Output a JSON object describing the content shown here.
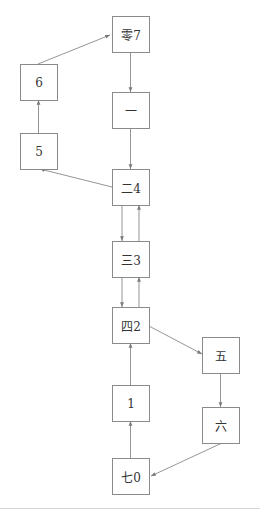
{
  "diagram": {
    "type": "directed-graph",
    "colors": {
      "node_border": "#8a8a8a",
      "edge": "#7a7a7a",
      "text": "#333333",
      "separator": "#d4d4d4"
    },
    "nodes": [
      {
        "id": "n_ling7",
        "label": "零7",
        "x": 112,
        "y": 16
      },
      {
        "id": "n_yi",
        "label": "一",
        "x": 112,
        "y": 92
      },
      {
        "id": "n_er4",
        "label": "二4",
        "x": 112,
        "y": 169
      },
      {
        "id": "n_san3",
        "label": "三3",
        "x": 112,
        "y": 241
      },
      {
        "id": "n_si2",
        "label": "四2",
        "x": 112,
        "y": 307
      },
      {
        "id": "n_1",
        "label": "1",
        "x": 112,
        "y": 385
      },
      {
        "id": "n_qi0",
        "label": "七0",
        "x": 112,
        "y": 458
      },
      {
        "id": "n_6",
        "label": "6",
        "x": 20,
        "y": 64
      },
      {
        "id": "n_5",
        "label": "5",
        "x": 20,
        "y": 133
      },
      {
        "id": "n_wu",
        "label": "五",
        "x": 202,
        "y": 337
      },
      {
        "id": "n_liu",
        "label": "六",
        "x": 202,
        "y": 407
      }
    ],
    "edges": [
      {
        "from": "零7",
        "to": "一"
      },
      {
        "from": "一",
        "to": "二4"
      },
      {
        "from": "二4",
        "to": "5"
      },
      {
        "from": "5",
        "to": "6"
      },
      {
        "from": "6",
        "to": "零7"
      },
      {
        "from": "二4",
        "to": "三3"
      },
      {
        "from": "三3",
        "to": "二4"
      },
      {
        "from": "三3",
        "to": "四2"
      },
      {
        "from": "四2",
        "to": "三3"
      },
      {
        "from": "四2",
        "to": "五"
      },
      {
        "from": "五",
        "to": "六"
      },
      {
        "from": "六",
        "to": "七0"
      },
      {
        "from": "七0",
        "to": "1"
      },
      {
        "from": "1",
        "to": "四2"
      }
    ]
  }
}
